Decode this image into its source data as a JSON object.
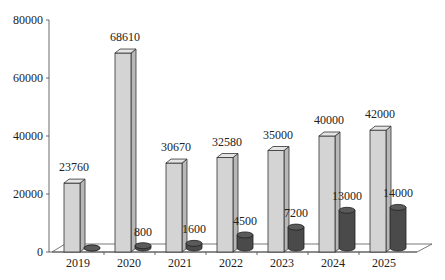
{
  "chart_data": {
    "type": "bar",
    "style": "3d-clustered-bar-and-cylinder",
    "title": "",
    "xlabel": "",
    "ylabel": "",
    "ylim": [
      0,
      80000
    ],
    "yticks": [
      "0",
      "20000",
      "40000",
      "60000",
      "80000"
    ],
    "grid": false,
    "legend": "none",
    "categories": [
      "2019",
      "2020",
      "2021",
      "2022",
      "2023",
      "2024",
      "2025"
    ],
    "series": [
      {
        "name": "Series 1",
        "shape": "box",
        "color": "#d4d4d4",
        "values": [
          23760,
          68610,
          30670,
          32580,
          35000,
          40000,
          42000
        ]
      },
      {
        "name": "Series 2",
        "shape": "cylinder",
        "color": "#4a4a4a",
        "values": [
          0,
          800,
          1600,
          4500,
          7200,
          13000,
          14000
        ]
      }
    ],
    "data_labels": {
      "Series 1": [
        "23760",
        "68610",
        "30670",
        "32580",
        "35000",
        "40000",
        "42000"
      ],
      "Series 2": [
        "",
        "800",
        "1600",
        "4500",
        "7200",
        "13000",
        "14000"
      ]
    }
  }
}
